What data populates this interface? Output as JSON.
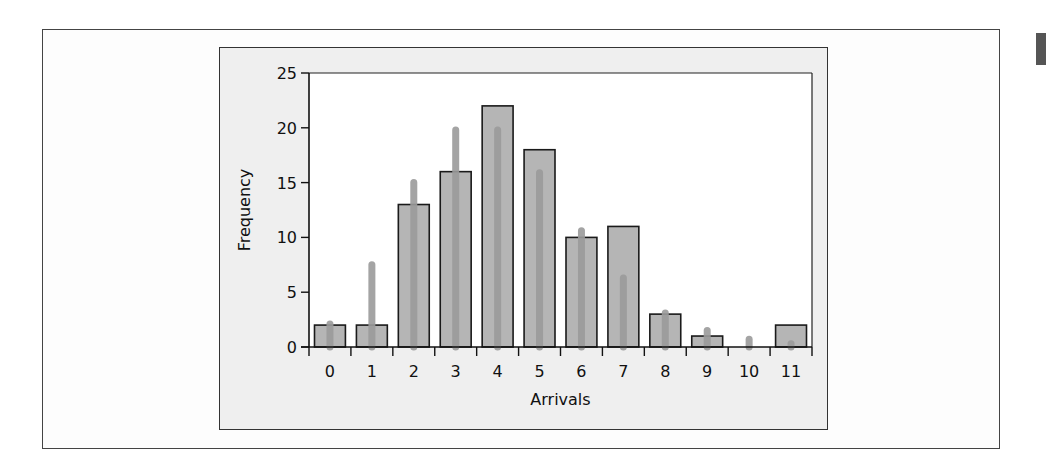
{
  "chart_data": {
    "type": "bar",
    "title": "",
    "xlabel": "Arrivals",
    "ylabel": "Frequency",
    "categories": [
      "0",
      "1",
      "2",
      "3",
      "4",
      "5",
      "6",
      "7",
      "8",
      "9",
      "10",
      "11"
    ],
    "series": [
      {
        "name": "Observed frequency",
        "kind": "bar",
        "values": [
          2,
          2,
          13,
          16,
          22,
          18,
          10,
          11,
          3,
          1,
          0,
          2
        ]
      },
      {
        "name": "Expected frequency",
        "kind": "line-overlay",
        "values": [
          2.1,
          7.5,
          15,
          19.8,
          19.8,
          15.9,
          10.6,
          6.3,
          3.1,
          1.5,
          0.7,
          0.3
        ]
      }
    ],
    "ylim": [
      0,
      25
    ],
    "yticks": [
      0,
      5,
      10,
      15,
      20,
      25
    ],
    "grid": false,
    "legend": null
  },
  "colors": {
    "bar_fill": "#b5b5b5",
    "bar_stroke": "#1a1a1a",
    "overlay": "#9b9b9b",
    "panel_bg": "#efefef",
    "plot_bg": "#ffffff"
  }
}
